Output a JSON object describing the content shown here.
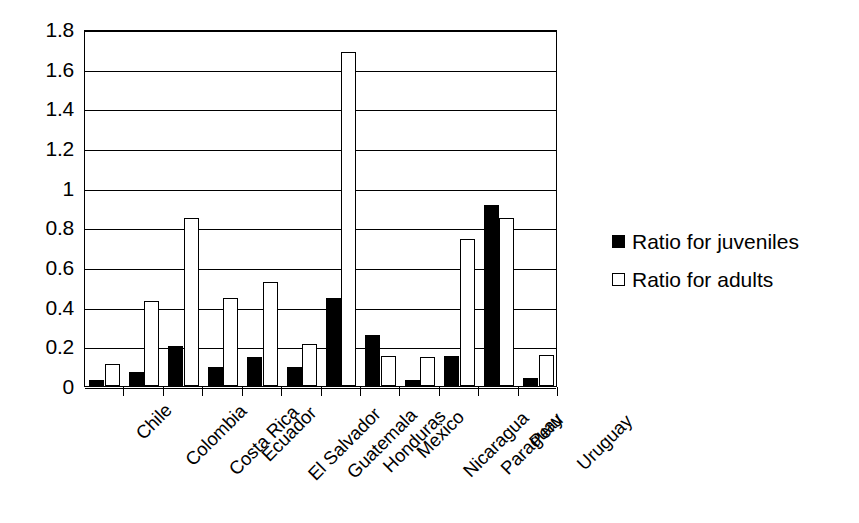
{
  "chart_data": {
    "type": "bar",
    "title": "",
    "subtitle": "",
    "xlabel": "",
    "ylabel": "",
    "ylim": [
      0,
      1.8
    ],
    "yticks": [
      "0",
      "0.2",
      "0.4",
      "0.6",
      "0.8",
      "1",
      "1.2",
      "1.4",
      "1.6",
      "1.8"
    ],
    "ytick_values": [
      0,
      0.2,
      0.4,
      0.6,
      0.8,
      1,
      1.2,
      1.4,
      1.6,
      1.8
    ],
    "grid": true,
    "grid_axis": "y",
    "legend_position": "right",
    "categories": [
      "Chile",
      "Colombia",
      "Costa Rica",
      "Ecuador",
      "El Salvador",
      "Guatemala",
      "Honduras",
      "Mexico",
      "Nicaragua",
      "Paraguay",
      "Peru",
      "Uruguay"
    ],
    "series": [
      {
        "name": "Ratio for juveniles",
        "color": "#000000",
        "fill": "solid",
        "values": [
          0.03,
          0.07,
          0.2,
          0.095,
          0.145,
          0.095,
          0.445,
          0.255,
          0.03,
          0.15,
          0.915,
          0.04
        ]
      },
      {
        "name": "Ratio for adults",
        "color": "#ffffff",
        "fill": "open",
        "values": [
          0.11,
          0.43,
          0.845,
          0.445,
          0.525,
          0.21,
          1.685,
          0.15,
          0.145,
          0.74,
          0.845,
          0.155
        ]
      }
    ]
  },
  "legend": {
    "items": [
      {
        "label": "Ratio for juveniles",
        "marker": "filled-square-icon"
      },
      {
        "label": "Ratio for adults",
        "marker": "open-square-icon"
      }
    ]
  }
}
